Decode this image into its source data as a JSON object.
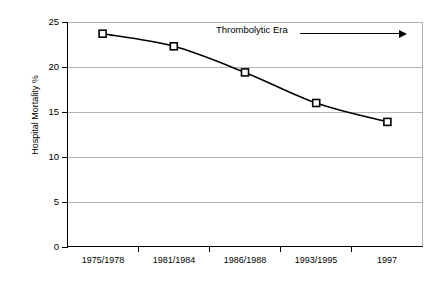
{
  "chart_data": {
    "type": "line",
    "title": "",
    "xlabel": "",
    "ylabel": "Hospital Mortality %",
    "categories": [
      "1975/1978",
      "1981/1984",
      "1986/1988",
      "1993/1995",
      "1997"
    ],
    "values": [
      23.7,
      22.3,
      19.4,
      16.0,
      13.9
    ],
    "series": [
      {
        "name": "Hospital Mortality %",
        "values": [
          23.7,
          22.3,
          19.4,
          16.0,
          13.9
        ]
      }
    ],
    "ylim": [
      0,
      25
    ],
    "yticks": [
      0,
      5,
      10,
      15,
      20,
      25
    ],
    "ytick_labels": [
      "0",
      "5",
      "10",
      "15",
      "20",
      "25"
    ],
    "grid": "horizontal",
    "legend": "none",
    "marker": "open-square",
    "line_color": "#000000",
    "grid_color": "#b4b4b4",
    "annotations": [
      {
        "text": "Thrombolytic Era",
        "arrow": "right-arrow"
      }
    ]
  },
  "axis": {
    "y_title": "Hospital Mortality %",
    "y_labels": [
      "25",
      "20",
      "15",
      "10",
      "5",
      "0"
    ],
    "x_labels": [
      "1975/1978",
      "1981/1984",
      "1986/1988",
      "1993/1995",
      "1997"
    ]
  },
  "annotation": {
    "label": "Thrombolytic Era"
  }
}
